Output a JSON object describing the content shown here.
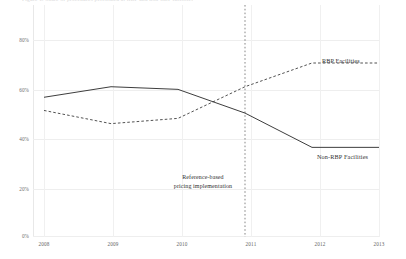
{
  "top_clipped_title": "Figure 1. Share of procedures performed at RBP and non-RBP facilities",
  "chart_data": {
    "type": "line",
    "title": "",
    "subtitle": "",
    "xlabel": "",
    "ylabel": "",
    "categories": [
      "2008",
      "2009",
      "2010",
      "2011",
      "2012",
      "2013"
    ],
    "x": [
      2008,
      2009,
      2010,
      2011,
      2012,
      2013
    ],
    "xlim": [
      2008,
      2013
    ],
    "ylim": [
      0,
      88
    ],
    "ytick_values": [
      0,
      20,
      40,
      60,
      80
    ],
    "ytick_labels": [
      "0%",
      "20%",
      "40%",
      "60%",
      "80%"
    ],
    "grid": true,
    "grid_axis": "both",
    "legend_position": "inline-end-of-line",
    "series": [
      {
        "name": "RBP Facilities",
        "style": "dashed",
        "color": "#333333",
        "values": [
          48,
          43,
          45,
          57,
          66,
          66
        ],
        "label_text": "RBP Facilities"
      },
      {
        "name": "Non-RBP Facilities",
        "style": "solid",
        "color": "#333333",
        "values": [
          53,
          57,
          56,
          47,
          34,
          34
        ],
        "label_text": "Non-RBP Facilities"
      }
    ],
    "annotations": [
      {
        "name": "reference-line-2011",
        "type": "vline",
        "x": 2011,
        "style": "dotted",
        "color": "#555555",
        "text_line_1": "Reference-based",
        "text_line_2": "pricing implementation"
      }
    ]
  },
  "colors": {
    "background": "#ffffff",
    "gridline": "#eeeeee",
    "line": "#333333",
    "text": "#2f2f2f",
    "tick_text": "#5f5f5f"
  }
}
